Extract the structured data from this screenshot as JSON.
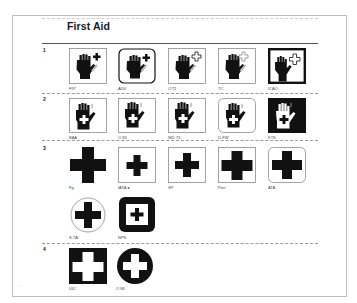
{
  "page": {
    "title": "First Aid",
    "footer_mark": "—"
  },
  "rows": [
    {
      "number": "1",
      "items": [
        {
          "label": "F97",
          "style": "square-frame"
        },
        {
          "label": "ADV",
          "style": "rounded-frame"
        },
        {
          "label": "O'72",
          "style": "square-frame-outline-cross"
        },
        {
          "label": "TC",
          "style": "square-frame-outline-cross"
        },
        {
          "label": "ICAO",
          "style": "heavy-frame-outline-cross"
        }
      ]
    },
    {
      "number": "2",
      "items": [
        {
          "label": "BAA",
          "style": "square-frame"
        },
        {
          "label": "O 84",
          "style": "square-frame"
        },
        {
          "label": "WD 73",
          "style": "square-frame"
        },
        {
          "label": "D-FW",
          "style": "rounded-frame"
        },
        {
          "label": "KTS",
          "style": "inverted"
        }
      ]
    },
    {
      "number": "3",
      "items": [
        {
          "label": "Fg",
          "style": "plain-cross-large"
        },
        {
          "label": "IATA ●",
          "style": "square-frame-small-cross"
        },
        {
          "label": "SP",
          "style": "square-frame-cross"
        },
        {
          "label": "Port",
          "style": "square-frame-cross-large"
        },
        {
          "label": "ATA",
          "style": "rounded-frame-cross"
        },
        {
          "label": "S-TA",
          "style": "circle-frame-cross"
        },
        {
          "label": "NPS",
          "style": "black-rounded-square-white-inner"
        }
      ]
    },
    {
      "number": "4",
      "items": [
        {
          "label": "UIC",
          "style": "black-square-white-cross"
        },
        {
          "label": "O 86",
          "style": "black-circle-white-cross"
        }
      ]
    }
  ],
  "colors": {
    "ink": "#111111",
    "frame": "#8c8c8c",
    "page_border": "#bdbdbd",
    "background": "#ffffff"
  }
}
